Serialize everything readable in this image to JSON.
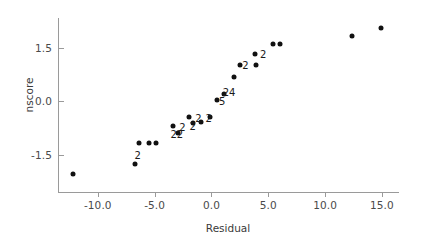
{
  "chart_data": {
    "type": "scatter",
    "title": "",
    "xlabel": "Residual",
    "ylabel": "nscore",
    "xlim": [
      -13.5,
      16.5
    ],
    "ylim": [
      -2.55,
      2.35
    ],
    "xticks": [
      -10.0,
      -5.0,
      0.0,
      5.0,
      10.0,
      15.0
    ],
    "xtick_labels": [
      "-10.0",
      "-5.0",
      "0.0",
      "5.0",
      "10.0",
      "15.0"
    ],
    "yticks": [
      1.5,
      0.0,
      -1.5
    ],
    "ytick_labels": [
      "1.5",
      "0.0",
      "-1.5"
    ],
    "grid": false,
    "legend": null,
    "marker": "filled-circle",
    "marker_color": "#111111",
    "axis_color": "#9a9a9a",
    "points": [
      {
        "x": -12.2,
        "y": -2.05,
        "count": 1
      },
      {
        "x": -6.7,
        "y": -1.75,
        "count": 1
      },
      {
        "x": -6.4,
        "y": -1.17,
        "count": 2
      },
      {
        "x": -5.5,
        "y": -1.17,
        "count": 1
      },
      {
        "x": -4.9,
        "y": -1.17,
        "count": 1
      },
      {
        "x": -3.4,
        "y": -0.7,
        "count": 2
      },
      {
        "x": -2.9,
        "y": -0.88,
        "count": 2
      },
      {
        "x": -2.0,
        "y": -0.45,
        "count": 2
      },
      {
        "x": -1.6,
        "y": -0.62,
        "count": 2
      },
      {
        "x": -0.9,
        "y": -0.58,
        "count": 2
      },
      {
        "x": -0.1,
        "y": -0.44,
        "count": 1
      },
      {
        "x": 0.45,
        "y": 0.03,
        "count": 5
      },
      {
        "x": 1.1,
        "y": 0.22,
        "count": 24
      },
      {
        "x": 1.95,
        "y": 0.68,
        "count": 1
      },
      {
        "x": 2.5,
        "y": 1.03,
        "count": 2
      },
      {
        "x": 3.85,
        "y": 1.35,
        "count": 1
      },
      {
        "x": 3.9,
        "y": 1.02,
        "count": 2
      },
      {
        "x": 5.4,
        "y": 1.62,
        "count": 1
      },
      {
        "x": 6.05,
        "y": 1.62,
        "count": 1
      },
      {
        "x": 12.4,
        "y": 1.85,
        "count": 1
      },
      {
        "x": 14.9,
        "y": 2.08,
        "count": 1
      }
    ],
    "count_labels": [
      {
        "text": "2",
        "x": -6.5,
        "y": -1.52
      },
      {
        "text": "22",
        "x": -3.05,
        "y": -0.93
      },
      {
        "text": "2",
        "x": -2.55,
        "y": -0.72
      },
      {
        "text": "2",
        "x": -1.65,
        "y": -0.7
      },
      {
        "text": "2",
        "x": -1.15,
        "y": -0.48
      },
      {
        "text": "2",
        "x": -0.25,
        "y": -0.48
      },
      {
        "text": "5",
        "x": 0.95,
        "y": 0.0
      },
      {
        "text": "24",
        "x": 1.55,
        "y": 0.28
      },
      {
        "text": "2",
        "x": 3.0,
        "y": 1.04
      },
      {
        "text": "2",
        "x": 4.55,
        "y": 1.33
      }
    ]
  }
}
